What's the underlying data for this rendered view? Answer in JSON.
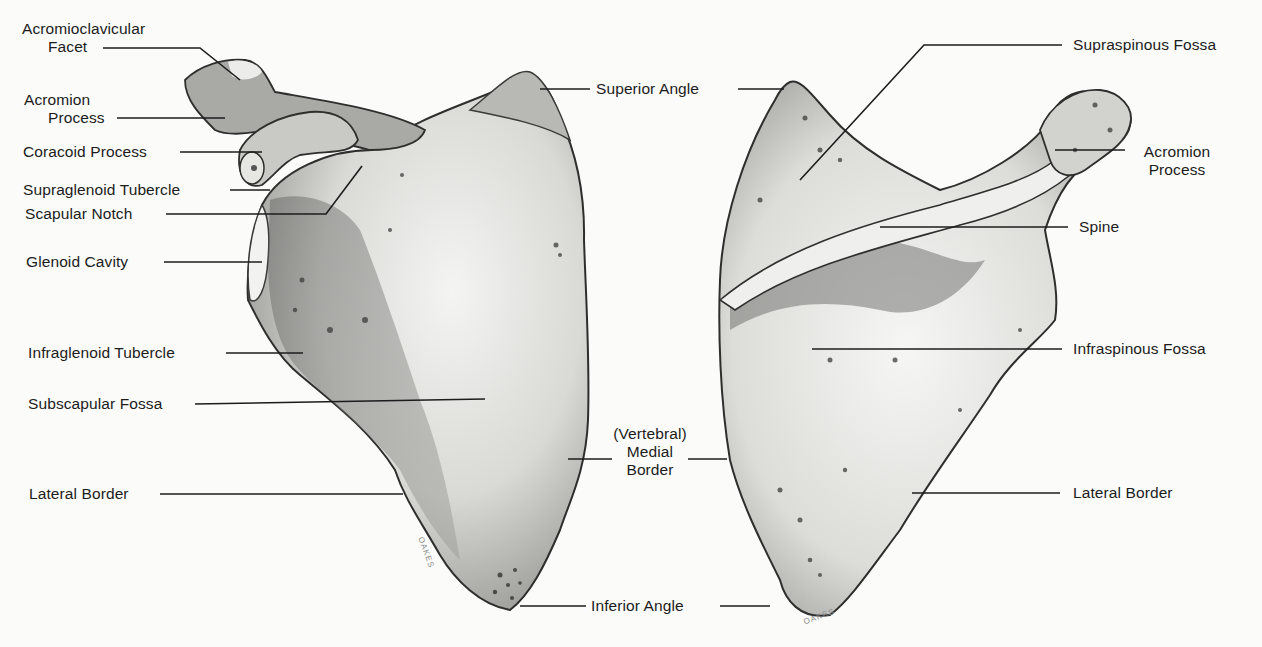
{
  "figure": {
    "subject": "Scapula",
    "views": [
      {
        "name": "anterior-view",
        "position": "left"
      },
      {
        "name": "posterior-view",
        "position": "right"
      }
    ],
    "paper_color": "#fbfbf9",
    "ink_color": "#1c1c1c"
  },
  "left_labels": {
    "acromioclavicular_facet": {
      "line1": "Acromioclavicular",
      "line2": "Facet"
    },
    "acromion_process": {
      "line1": "Acromion",
      "line2": "Process"
    },
    "coracoid_process": "Coracoid Process",
    "supraglenoid_tubercle": "Supraglenoid Tubercle",
    "scapular_notch": "Scapular Notch",
    "glenoid_cavity": "Glenoid Cavity",
    "infraglenoid_tubercle": "Infraglenoid Tubercle",
    "subscapular_fossa": "Subscapular Fossa",
    "lateral_border": "Lateral Border"
  },
  "center_labels": {
    "superior_angle": "Superior Angle",
    "medial_border": {
      "line1": "(Vertebral)",
      "line2": "Medial",
      "line3": "Border"
    },
    "inferior_angle": "Inferior Angle"
  },
  "right_labels": {
    "supraspinous_fossa": "Supraspinous Fossa",
    "acromion_process": {
      "line1": "Acromion",
      "line2": "Process"
    },
    "spine": "Spine",
    "infraspinous_fossa": "Infraspinous Fossa",
    "lateral_border": "Lateral Border"
  },
  "signatures": {
    "left": "OAKES",
    "right": "OAKES"
  }
}
